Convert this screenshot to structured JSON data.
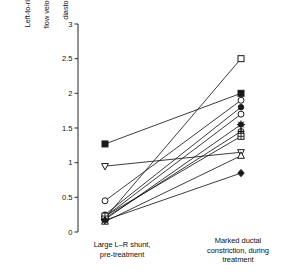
{
  "chart_data": {
    "type": "line",
    "title": "",
    "subtitle": "",
    "xlabel": "",
    "ylabel": "Left-to-right ductal flow velocity at end diastole (m/s)",
    "ylabel_lines": [
      "Left-to-right ductal",
      "flow velocity at end",
      "diastole (m/s)"
    ],
    "categories": [
      "Large L-R shunt, pre-treatment",
      "Marked ductal constriction, during treatment"
    ],
    "category_lines": [
      [
        "Large L–R shunt,",
        "pre-treatment"
      ],
      [
        "Marked ductal",
        "constriction, during",
        "treatment"
      ]
    ],
    "ylim": [
      0,
      3
    ],
    "yticks": [
      0,
      0.5,
      1,
      1.5,
      2,
      2.5,
      3
    ],
    "ytick_labels": [
      "0",
      "0.5",
      "1",
      "1.5",
      "2",
      "2.5",
      "3"
    ],
    "grid": false,
    "legend": "none",
    "line_color": "#1a1a1a",
    "marker_color": "#1a1a1a",
    "axis_color": "#3a3a3a",
    "background": "#ffffff",
    "n_subjects": 11,
    "series": [
      {
        "name": "subject-1",
        "marker": "open-square",
        "values": [
          0.2,
          2.5
        ]
      },
      {
        "name": "subject-2",
        "marker": "filled-square",
        "values": [
          1.27,
          2.0
        ]
      },
      {
        "name": "subject-3",
        "marker": "open-circle",
        "values": [
          0.45,
          1.9
        ]
      },
      {
        "name": "subject-4",
        "marker": "filled-circle",
        "values": [
          0.25,
          1.8
        ]
      },
      {
        "name": "subject-5",
        "marker": "open-circle",
        "values": [
          0.22,
          1.7
        ]
      },
      {
        "name": "subject-6",
        "marker": "star",
        "values": [
          0.18,
          1.55
        ]
      },
      {
        "name": "subject-7",
        "marker": "crossed-circle",
        "values": [
          0.2,
          1.45
        ]
      },
      {
        "name": "subject-8",
        "marker": "gridded-square",
        "values": [
          0.23,
          1.38
        ]
      },
      {
        "name": "subject-9",
        "marker": "inverted-triangle",
        "values": [
          0.95,
          1.15
        ]
      },
      {
        "name": "subject-10",
        "marker": "open-triangle",
        "values": [
          0.15,
          1.1
        ]
      },
      {
        "name": "subject-11",
        "marker": "filled-diamond",
        "values": [
          0.17,
          0.85
        ]
      }
    ]
  }
}
